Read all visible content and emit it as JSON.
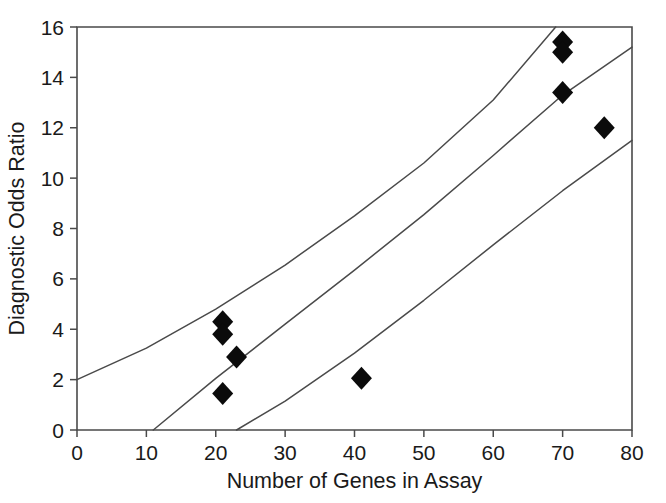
{
  "chart_data": {
    "type": "scatter",
    "title": "",
    "xlabel": "Number of Genes in Assay",
    "ylabel": "Diagnostic Odds Ratio",
    "xlim": [
      0,
      80
    ],
    "ylim": [
      0,
      16
    ],
    "xticks": [
      0,
      10,
      20,
      30,
      40,
      50,
      60,
      70,
      80
    ],
    "yticks": [
      0,
      2,
      4,
      6,
      8,
      10,
      12,
      14,
      16
    ],
    "xtick_labels": [
      "0",
      "10",
      "20",
      "30",
      "40",
      "50",
      "60",
      "70",
      "80"
    ],
    "ytick_labels": [
      "0",
      "2",
      "4",
      "6",
      "8",
      "10",
      "12",
      "14",
      "16"
    ],
    "grid": false,
    "legend": null,
    "legend_position": "none",
    "marker_style": "filled-diamond",
    "points": [
      {
        "x": 21.0,
        "y": 4.3
      },
      {
        "x": 21.0,
        "y": 3.8
      },
      {
        "x": 23.0,
        "y": 2.9
      },
      {
        "x": 21.0,
        "y": 1.45
      },
      {
        "x": 41.0,
        "y": 2.05
      },
      {
        "x": 70.0,
        "y": 15.4
      },
      {
        "x": 70.0,
        "y": 15.0
      },
      {
        "x": 70.0,
        "y": 13.4
      },
      {
        "x": 76.0,
        "y": 12.0
      }
    ],
    "series": [
      {
        "name": "upper confidence band",
        "type": "line",
        "points": [
          {
            "x": 0.0,
            "y": 2.0
          },
          {
            "x": 10.0,
            "y": 3.25
          },
          {
            "x": 20.0,
            "y": 4.8
          },
          {
            "x": 30.0,
            "y": 6.55
          },
          {
            "x": 40.0,
            "y": 8.5
          },
          {
            "x": 50.0,
            "y": 10.6
          },
          {
            "x": 60.0,
            "y": 13.1
          },
          {
            "x": 69.0,
            "y": 16.0
          }
        ]
      },
      {
        "name": "fitted regression line",
        "type": "line",
        "points": [
          {
            "x": 11.0,
            "y": 0.0
          },
          {
            "x": 20.0,
            "y": 2.05
          },
          {
            "x": 30.0,
            "y": 4.2
          },
          {
            "x": 40.0,
            "y": 6.35
          },
          {
            "x": 50.0,
            "y": 8.55
          },
          {
            "x": 60.0,
            "y": 10.9
          },
          {
            "x": 70.0,
            "y": 13.3
          },
          {
            "x": 80.0,
            "y": 15.2
          }
        ]
      },
      {
        "name": "lower confidence band",
        "type": "line",
        "points": [
          {
            "x": 23.0,
            "y": 0.0
          },
          {
            "x": 30.0,
            "y": 1.15
          },
          {
            "x": 40.0,
            "y": 3.05
          },
          {
            "x": 50.0,
            "y": 5.15
          },
          {
            "x": 60.0,
            "y": 7.35
          },
          {
            "x": 70.0,
            "y": 9.5
          },
          {
            "x": 80.0,
            "y": 11.5
          }
        ]
      }
    ]
  }
}
